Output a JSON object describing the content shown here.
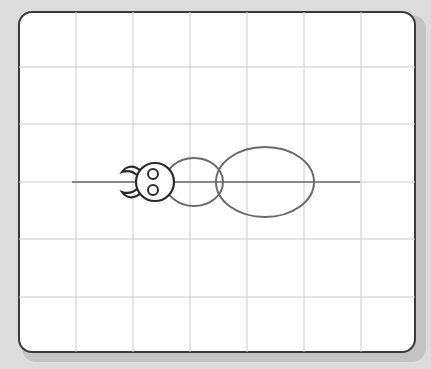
{
  "canvas": {
    "background": "#dcdcdc",
    "paper": "#ffffff",
    "frame_color": "#3a3a3a",
    "grid_color": "#c8c8c8"
  },
  "grid": {
    "vertical_x": [
      76,
      133,
      190,
      247,
      304,
      361
    ],
    "horizontal_y": [
      67,
      124,
      182,
      239,
      297
    ]
  },
  "drawing": {
    "subject": "insect sketch (ant/beetle outline)",
    "axis_line": {
      "x1": 72,
      "x2": 360,
      "y": 182,
      "color": "#6a6a6a"
    },
    "head": {
      "cx": 155,
      "cy": 182,
      "r": 19,
      "color": "#2a2a2a"
    },
    "eyes": [
      {
        "cx": 153,
        "cy": 174,
        "r": 5
      },
      {
        "cx": 153,
        "cy": 190,
        "r": 5
      }
    ],
    "thorax": {
      "cx": 194,
      "cy": 182,
      "rx": 29,
      "ry": 24,
      "color": "#6a6a6a"
    },
    "abdomen": {
      "cx": 265,
      "cy": 182,
      "rx": 49,
      "ry": 35,
      "color": "#6a6a6a"
    }
  }
}
